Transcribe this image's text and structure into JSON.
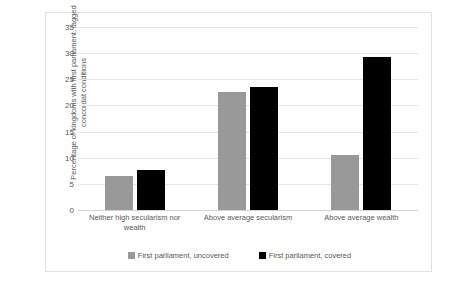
{
  "chart_data": {
    "type": "bar",
    "title": "",
    "xlabel": "",
    "ylabel": "Percentage of kingdoms with first parliament, lagged concordat conditions",
    "ylim": [
      0,
      35
    ],
    "ytick_step": 5,
    "yticks": [
      "0",
      "5",
      "10",
      "15",
      "20",
      "25",
      "30",
      "35"
    ],
    "grid": true,
    "legend_position": "bottom",
    "categories": [
      "Neither high secularism nor wealth",
      "Above average secularism",
      "Above average wealth"
    ],
    "series": [
      {
        "name": "First parliament, uncovered",
        "color": "#999999",
        "values": [
          6.5,
          22.6,
          10.5
        ]
      },
      {
        "name": "First parliament, covered",
        "color": "#000000",
        "values": [
          7.7,
          23.6,
          29.3
        ]
      }
    ]
  }
}
